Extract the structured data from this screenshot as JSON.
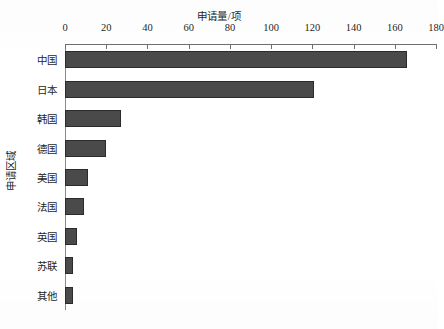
{
  "chart_data": {
    "type": "bar",
    "orientation": "horizontal",
    "title": "",
    "xlabel": "申请量/项",
    "ylabel": "申请区域",
    "categories": [
      "中国",
      "日本",
      "韩国",
      "德国",
      "美国",
      "法国",
      "英国",
      "苏联",
      "其他"
    ],
    "values": [
      166,
      121,
      27,
      20,
      11,
      9,
      6,
      4,
      4
    ],
    "xlim": [
      0,
      180
    ],
    "xticks": [
      0,
      20,
      40,
      60,
      80,
      100,
      120,
      140,
      160,
      180
    ],
    "xtick_labels": [
      "0",
      "20",
      "40",
      "60",
      "80",
      "100",
      "120",
      "140",
      "160",
      "180"
    ],
    "grid": false,
    "legend": null,
    "x_axis_position": "top",
    "bar_color": "#4a4a4a",
    "bar_edge_color": "#2b2b2b",
    "axis_color": "#6e6e6e",
    "background": "#ffffff"
  }
}
